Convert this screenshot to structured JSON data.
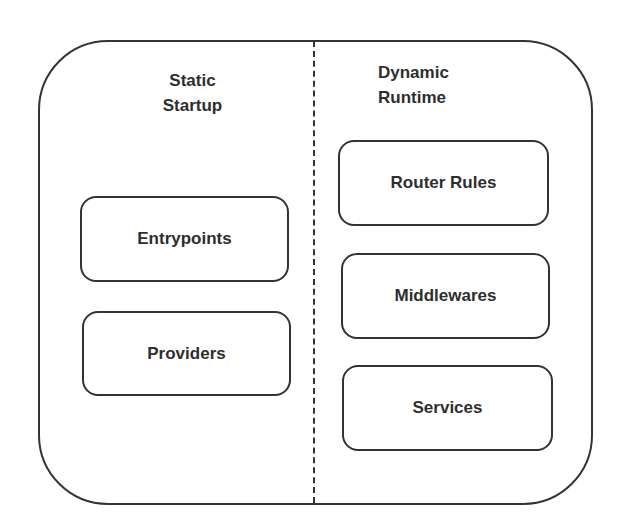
{
  "diagram": {
    "sections": [
      {
        "heading_line1": "Static",
        "heading_line2": "Startup",
        "items": [
          "Entrypoints",
          "Providers"
        ]
      },
      {
        "heading_line1": "Dynamic",
        "heading_line2": "Runtime",
        "items": [
          "Router Rules",
          "Middlewares",
          "Services"
        ]
      }
    ],
    "colors": {
      "stroke": "#333333",
      "text": "#2e2e2e",
      "background": "#ffffff"
    }
  }
}
